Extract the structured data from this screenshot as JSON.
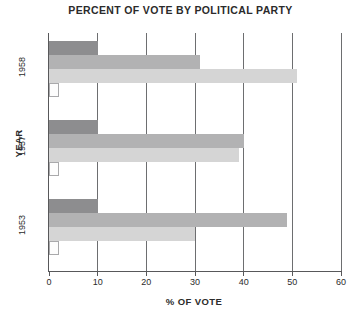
{
  "chart_data": {
    "type": "bar",
    "orientation": "horizontal",
    "title": "PERCENT OF VOTE BY POLITICAL PARTY",
    "xlabel": "% OF VOTE",
    "ylabel": "YEAR",
    "categories": [
      "1958",
      "1957",
      "1953"
    ],
    "xlim": [
      0,
      60
    ],
    "xticks": [
      0,
      10,
      20,
      30,
      40,
      50,
      60
    ],
    "xtick_labels": [
      "0",
      "10",
      "20",
      "30",
      "40",
      "50",
      "60"
    ],
    "grid": true,
    "grid_axis": "x",
    "legend": "none",
    "series": [
      {
        "name": "series-1",
        "color": "#8d8d8f",
        "values": [
          10,
          10,
          10
        ]
      },
      {
        "name": "series-2",
        "color": "#b2b2b3",
        "values": [
          31,
          40,
          49
        ]
      },
      {
        "name": "series-3",
        "color": "#d5d5d5",
        "values": [
          51,
          39,
          30
        ]
      },
      {
        "name": "series-4",
        "color": "#fdfdfd",
        "values": [
          2,
          2,
          2
        ]
      }
    ]
  },
  "axes": {
    "x_title": "% OF VOTE",
    "y_title": "YEAR"
  }
}
